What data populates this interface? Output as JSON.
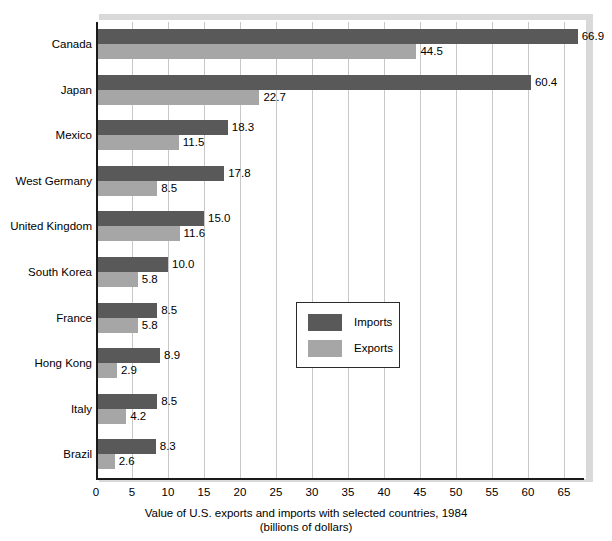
{
  "chart_data": {
    "type": "bar",
    "orientation": "horizontal",
    "title": "Value of U.S. exports and imports with selected countries, 1984",
    "subtitle": "(billions of dollars)",
    "xlabel": "",
    "ylabel": "",
    "xlim": [
      0,
      68
    ],
    "xticks": [
      0,
      5,
      10,
      15,
      20,
      25,
      30,
      35,
      40,
      45,
      50,
      55,
      60,
      65
    ],
    "xtick_labels": [
      "0",
      "5",
      "10",
      "15",
      "20",
      "25",
      "30",
      "35",
      "40",
      "45",
      "50",
      "55",
      "60",
      "65"
    ],
    "grid": "vertical",
    "legend_position": "center-right-inside",
    "categories": [
      "Canada",
      "Japan",
      "Mexico",
      "West Germany",
      "United Kingdom",
      "South Korea",
      "France",
      "Hong Kong",
      "Italy",
      "Brazil"
    ],
    "series": [
      {
        "name": "Imports",
        "color": "#595959",
        "values": [
          66.9,
          60.4,
          18.3,
          17.8,
          15.0,
          10.0,
          8.5,
          8.9,
          8.5,
          8.3
        ],
        "labels": [
          "66.9",
          "60.4",
          "18.3",
          "17.8",
          "15.0",
          "10.0",
          "8.5",
          "8.9",
          "8.5",
          "8.3"
        ]
      },
      {
        "name": "Exports",
        "color": "#a6a6a6",
        "values": [
          44.5,
          22.7,
          11.5,
          8.5,
          11.6,
          5.8,
          5.8,
          2.9,
          4.2,
          2.6
        ],
        "labels": [
          "44.5",
          "22.7",
          "11.5",
          "8.5",
          "11.6",
          "5.8",
          "5.8",
          "2.9",
          "4.2",
          "2.6"
        ]
      }
    ]
  },
  "legend": {
    "entries": [
      {
        "label": "Imports",
        "color": "#595959"
      },
      {
        "label": "Exports",
        "color": "#a6a6a6"
      }
    ]
  },
  "colors": {
    "imports": "#595959",
    "exports": "#a6a6a6",
    "gridline": "#c8c8c8",
    "axis": "#1a1a1a",
    "frame_shadow": "#d9d9d9",
    "background": "#ffffff"
  }
}
